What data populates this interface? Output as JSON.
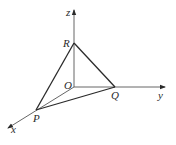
{
  "diagram": {
    "type": "3d-coordinate-axes-tetrahedron",
    "axes": {
      "x": {
        "label": "x"
      },
      "y": {
        "label": "y"
      },
      "z": {
        "label": "z"
      }
    },
    "points": {
      "O": {
        "label": "O",
        "description": "origin"
      },
      "P": {
        "label": "P",
        "on_axis": "x"
      },
      "Q": {
        "label": "Q",
        "on_axis": "y"
      },
      "R": {
        "label": "R",
        "on_axis": "z"
      }
    },
    "edges": [
      "PR",
      "RQ",
      "PQ",
      "OP",
      "OQ",
      "OR"
    ],
    "colors": {
      "line": "#3a3a3a",
      "background": "#ffffff"
    }
  }
}
